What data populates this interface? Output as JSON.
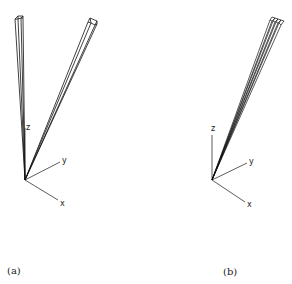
{
  "figure": {
    "panels": [
      {
        "id": "a",
        "caption": "(a)",
        "axes": {
          "x_label": "x",
          "y_label": "y",
          "z_label": "z"
        },
        "prism_count": 2
      },
      {
        "id": "b",
        "caption": "(b)",
        "axes": {
          "x_label": "x",
          "y_label": "y",
          "z_label": "z"
        },
        "prism_count": 4
      }
    ],
    "colors": {
      "stroke": "#111111",
      "axis": "#333333",
      "background": "#ffffff"
    }
  }
}
